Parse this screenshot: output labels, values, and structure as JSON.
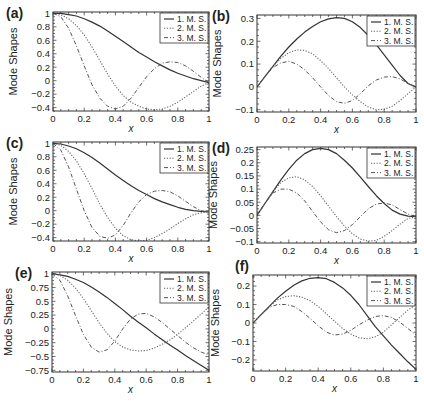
{
  "figure": {
    "panels_count": 6,
    "colors": {
      "axis": "#333333",
      "mode1": "#333333",
      "mode2": "#666666",
      "mode3": "#555555",
      "background": "#ffffff"
    }
  },
  "chart_data": [
    {
      "panel": "(a)",
      "type": "line",
      "title": "",
      "xlabel": "x",
      "ylabel": "Mode Shapes",
      "xlim": [
        0,
        1
      ],
      "ylim": [
        -0.45,
        1.02
      ],
      "xticks": [
        "0",
        "0.2",
        "0.4",
        "0.6",
        "0.8",
        "1"
      ],
      "yticks": [
        "1",
        "0.8",
        "0.6",
        "0.4",
        "0.2",
        "0",
        "-0.2",
        "-0.4"
      ],
      "ytick_values": [
        1,
        0.8,
        0.6,
        0.4,
        0.2,
        0,
        -0.2,
        -0.4
      ],
      "legend": [
        "1. M. S.",
        "2. M. S.",
        "3. M. S."
      ],
      "legend_position": "upper right",
      "grid": false,
      "box": [
        53,
        12,
        209,
        111
      ],
      "x": [
        0,
        0.05,
        0.1,
        0.15,
        0.2,
        0.25,
        0.3,
        0.35,
        0.4,
        0.45,
        0.5,
        0.55,
        0.6,
        0.65,
        0.7,
        0.75,
        0.8,
        0.85,
        0.9,
        0.95,
        1
      ],
      "series": [
        {
          "name": "1. M. S.",
          "values": [
            1,
            1,
            0.98,
            0.96,
            0.92,
            0.87,
            0.81,
            0.74,
            0.66,
            0.58,
            0.5,
            0.42,
            0.35,
            0.28,
            0.22,
            0.16,
            0.11,
            0.07,
            0.03,
            0.0,
            -0.03
          ]
        },
        {
          "name": "2. M. S.",
          "values": [
            1,
            0.98,
            0.92,
            0.82,
            0.68,
            0.5,
            0.3,
            0.1,
            -0.08,
            -0.22,
            -0.32,
            -0.38,
            -0.42,
            -0.43,
            -0.42,
            -0.38,
            -0.32,
            -0.24,
            -0.16,
            -0.08,
            -0.03
          ]
        },
        {
          "name": "3. M. S.",
          "values": [
            1,
            0.95,
            0.78,
            0.52,
            0.22,
            -0.06,
            -0.26,
            -0.38,
            -0.42,
            -0.38,
            -0.26,
            -0.1,
            0.06,
            0.18,
            0.26,
            0.28,
            0.27,
            0.22,
            0.14,
            0.05,
            -0.03
          ]
        }
      ]
    },
    {
      "panel": "(b)",
      "type": "line",
      "title": "",
      "xlabel": "x",
      "ylabel": "Mode Shapes",
      "xlim": [
        0,
        1
      ],
      "ylim": [
        -0.11,
        0.315
      ],
      "xticks": [
        "0",
        "0.2",
        "0.4",
        "0.6",
        "0.8",
        "1"
      ],
      "yticks": [
        "0.3",
        "0.2",
        "0.1",
        "0",
        "-0.1"
      ],
      "ytick_values": [
        0.3,
        0.2,
        0.1,
        0,
        -0.1
      ],
      "legend": [
        "1. M. S.",
        "2. M. S.",
        "3. M. S."
      ],
      "legend_position": "upper right",
      "grid": false,
      "box": [
        257,
        15,
        416,
        112
      ],
      "x": [
        0,
        0.05,
        0.1,
        0.15,
        0.2,
        0.25,
        0.3,
        0.35,
        0.4,
        0.45,
        0.5,
        0.55,
        0.6,
        0.65,
        0.7,
        0.75,
        0.8,
        0.85,
        0.9,
        0.95,
        1
      ],
      "series": [
        {
          "name": "1. M. S.",
          "values": [
            0,
            0.045,
            0.09,
            0.135,
            0.175,
            0.21,
            0.24,
            0.265,
            0.285,
            0.298,
            0.303,
            0.3,
            0.285,
            0.26,
            0.225,
            0.185,
            0.14,
            0.095,
            0.05,
            0.015,
            0
          ]
        },
        {
          "name": "2. M. S.",
          "values": [
            0,
            0.045,
            0.09,
            0.125,
            0.15,
            0.162,
            0.16,
            0.145,
            0.115,
            0.08,
            0.04,
            0.0,
            -0.035,
            -0.065,
            -0.088,
            -0.1,
            -0.098,
            -0.085,
            -0.06,
            -0.03,
            0
          ]
        },
        {
          "name": "3. M. S.",
          "values": [
            0,
            0.045,
            0.085,
            0.105,
            0.112,
            0.1,
            0.075,
            0.04,
            0.0,
            -0.038,
            -0.065,
            -0.072,
            -0.06,
            -0.03,
            0.005,
            0.03,
            0.043,
            0.045,
            0.035,
            0.015,
            0
          ]
        }
      ]
    },
    {
      "panel": "(c)",
      "type": "line",
      "title": "",
      "xlabel": "x",
      "ylabel": "Mode Shapes",
      "xlim": [
        0,
        1
      ],
      "ylim": [
        -0.45,
        1.02
      ],
      "xticks": [
        "0",
        "0.2",
        "0.4",
        "0.6",
        "0.8",
        "1"
      ],
      "yticks": [
        "1",
        "0.8",
        "0.6",
        "0.4",
        "0.2",
        "0",
        "-0.2",
        "-0.4"
      ],
      "ytick_values": [
        1,
        0.8,
        0.6,
        0.4,
        0.2,
        0,
        -0.2,
        -0.4
      ],
      "legend": [
        "1. M. S.",
        "2. M. S.",
        "3. M. S."
      ],
      "legend_position": "upper right",
      "grid": false,
      "box": [
        53,
        142,
        209,
        241
      ],
      "x": [
        0,
        0.05,
        0.1,
        0.15,
        0.2,
        0.25,
        0.3,
        0.35,
        0.4,
        0.45,
        0.5,
        0.55,
        0.6,
        0.65,
        0.7,
        0.75,
        0.8,
        0.85,
        0.9,
        0.95,
        1
      ],
      "series": [
        {
          "name": "1. M. S.",
          "values": [
            1,
            0.99,
            0.96,
            0.92,
            0.86,
            0.79,
            0.71,
            0.62,
            0.53,
            0.45,
            0.37,
            0.3,
            0.24,
            0.18,
            0.13,
            0.09,
            0.05,
            0.02,
            0.0,
            -0.01,
            -0.02
          ]
        },
        {
          "name": "2. M. S.",
          "values": [
            1,
            0.97,
            0.88,
            0.74,
            0.55,
            0.33,
            0.1,
            -0.1,
            -0.26,
            -0.37,
            -0.43,
            -0.45,
            -0.44,
            -0.4,
            -0.34,
            -0.27,
            -0.19,
            -0.12,
            -0.06,
            -0.03,
            -0.02
          ]
        },
        {
          "name": "3. M. S.",
          "values": [
            1,
            0.9,
            0.65,
            0.32,
            -0.0,
            -0.25,
            -0.38,
            -0.41,
            -0.36,
            -0.22,
            -0.03,
            0.13,
            0.24,
            0.29,
            0.3,
            0.28,
            0.22,
            0.14,
            0.06,
            0.0,
            -0.02
          ]
        }
      ]
    },
    {
      "panel": "(d)",
      "type": "line",
      "title": "",
      "xlabel": "x",
      "ylabel": "Mode Shapes",
      "xlim": [
        0,
        1
      ],
      "ylim": [
        -0.105,
        0.26
      ],
      "xticks": [
        "0",
        "0.2",
        "0.4",
        "0.6",
        "0.8",
        "1"
      ],
      "yticks": [
        "0.25",
        "0.2",
        "0.15",
        "0.1",
        "0.05",
        "0",
        "-0.05",
        "-0.1"
      ],
      "ytick_values": [
        0.25,
        0.2,
        0.15,
        0.1,
        0.05,
        0,
        -0.05,
        -0.1
      ],
      "legend": [
        "1. M. S.",
        "2. M. S.",
        "3. M. S."
      ],
      "legend_position": "upper right",
      "grid": false,
      "box": [
        257,
        147,
        416,
        243
      ],
      "x": [
        0,
        0.05,
        0.1,
        0.15,
        0.2,
        0.25,
        0.3,
        0.35,
        0.4,
        0.45,
        0.5,
        0.55,
        0.6,
        0.65,
        0.7,
        0.75,
        0.8,
        0.85,
        0.9,
        0.95,
        1
      ],
      "series": [
        {
          "name": "1. M. S.",
          "values": [
            0,
            0.045,
            0.09,
            0.135,
            0.175,
            0.21,
            0.235,
            0.25,
            0.255,
            0.25,
            0.235,
            0.21,
            0.18,
            0.145,
            0.11,
            0.075,
            0.045,
            0.02,
            0.005,
            -0.003,
            -0.005
          ]
        },
        {
          "name": "2. M. S.",
          "values": [
            0,
            0.045,
            0.09,
            0.125,
            0.143,
            0.147,
            0.135,
            0.11,
            0.075,
            0.035,
            -0.005,
            -0.04,
            -0.07,
            -0.09,
            -0.098,
            -0.095,
            -0.08,
            -0.058,
            -0.033,
            -0.012,
            -0.005
          ]
        },
        {
          "name": "3. M. S.",
          "values": [
            0,
            0.045,
            0.085,
            0.1,
            0.1,
            0.085,
            0.055,
            0.015,
            -0.025,
            -0.055,
            -0.066,
            -0.058,
            -0.035,
            -0.005,
            0.025,
            0.043,
            0.047,
            0.04,
            0.022,
            0.005,
            -0.005
          ]
        }
      ]
    },
    {
      "panel": "(e)",
      "type": "line",
      "title": "",
      "xlabel": "x",
      "ylabel": "Mode Shapes",
      "xlim": [
        0,
        1
      ],
      "ylim": [
        -0.78,
        1.03
      ],
      "xticks": [
        "0",
        "0.2",
        "0.4",
        "0.6",
        "0.8",
        "1"
      ],
      "yticks": [
        "1",
        "0.75",
        "0.5",
        "0.25",
        "0",
        "-0.25",
        "-0.5",
        "-0.75"
      ],
      "ytick_values": [
        1,
        0.75,
        0.5,
        0.25,
        0,
        -0.25,
        -0.5,
        -0.75
      ],
      "legend": [
        "1. M. S.",
        "2. M. S.",
        "3. M. S."
      ],
      "legend_position": "upper right",
      "grid": false,
      "box": [
        52,
        272,
        209,
        372
      ],
      "x": [
        0,
        0.05,
        0.1,
        0.15,
        0.2,
        0.25,
        0.3,
        0.35,
        0.4,
        0.45,
        0.5,
        0.55,
        0.6,
        0.65,
        0.7,
        0.75,
        0.8,
        0.85,
        0.9,
        0.95,
        1
      ],
      "series": [
        {
          "name": "1. M. S.",
          "values": [
            1,
            0.98,
            0.95,
            0.9,
            0.84,
            0.76,
            0.67,
            0.57,
            0.46,
            0.35,
            0.23,
            0.12,
            0.02,
            -0.09,
            -0.19,
            -0.29,
            -0.38,
            -0.48,
            -0.57,
            -0.66,
            -0.75
          ]
        },
        {
          "name": "2. M. S.",
          "values": [
            1,
            0.97,
            0.88,
            0.74,
            0.55,
            0.33,
            0.11,
            -0.08,
            -0.23,
            -0.33,
            -0.38,
            -0.4,
            -0.39,
            -0.35,
            -0.28,
            -0.2,
            -0.1,
            0.02,
            0.14,
            0.27,
            0.4
          ]
        },
        {
          "name": "3. M. S.",
          "values": [
            1,
            0.88,
            0.6,
            0.24,
            -0.1,
            -0.33,
            -0.42,
            -0.38,
            -0.22,
            0.0,
            0.18,
            0.27,
            0.28,
            0.22,
            0.12,
            0.0,
            -0.12,
            -0.24,
            -0.34,
            -0.42,
            -0.47
          ]
        }
      ]
    },
    {
      "panel": "(f)",
      "type": "line",
      "title": "",
      "xlabel": "x",
      "ylabel": "Mode Shapes",
      "xlim": [
        0,
        1
      ],
      "ylim": [
        -0.26,
        0.26
      ],
      "xticks": [
        "0",
        "0.2",
        "0.4",
        "0.6",
        "0.8",
        "1"
      ],
      "yticks": [
        "0.2",
        "0.1",
        "0",
        "-0.1",
        "-0.2"
      ],
      "ytick_values": [
        0.2,
        0.1,
        0,
        -0.1,
        -0.2
      ],
      "legend": [
        "1. M. S.",
        "2. M. S.",
        "3. M. S."
      ],
      "legend_position": "upper right",
      "grid": false,
      "box": [
        253,
        275,
        416,
        371
      ],
      "x": [
        0,
        0.05,
        0.1,
        0.15,
        0.2,
        0.25,
        0.3,
        0.35,
        0.4,
        0.45,
        0.5,
        0.55,
        0.6,
        0.65,
        0.7,
        0.75,
        0.8,
        0.85,
        0.9,
        0.95,
        1
      ],
      "series": [
        {
          "name": "1. M. S.",
          "values": [
            0,
            0.045,
            0.09,
            0.135,
            0.172,
            0.205,
            0.228,
            0.242,
            0.246,
            0.24,
            0.22,
            0.19,
            0.15,
            0.1,
            0.04,
            -0.02,
            -0.07,
            -0.12,
            -0.165,
            -0.21,
            -0.25
          ]
        },
        {
          "name": "2. M. S.",
          "values": [
            0,
            0.045,
            0.09,
            0.125,
            0.143,
            0.148,
            0.14,
            0.12,
            0.09,
            0.05,
            0.01,
            -0.03,
            -0.06,
            -0.08,
            -0.085,
            -0.075,
            -0.05,
            -0.01,
            0.03,
            0.07,
            0.1
          ]
        },
        {
          "name": "3. M. S.",
          "values": [
            0,
            0.045,
            0.085,
            0.1,
            0.1,
            0.09,
            0.062,
            0.025,
            -0.015,
            -0.05,
            -0.065,
            -0.06,
            -0.04,
            -0.01,
            0.015,
            0.035,
            0.04,
            0.03,
            0.005,
            -0.03,
            -0.065
          ]
        }
      ]
    }
  ]
}
